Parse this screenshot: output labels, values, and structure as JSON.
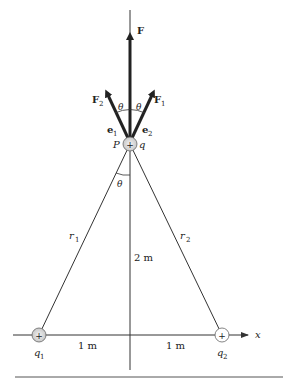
{
  "figure": {
    "labels": {
      "F": "F",
      "F1": "F",
      "F1_sub": "1",
      "F2": "F",
      "F2_sub": "2",
      "e1": "e",
      "e1_sub": "1",
      "e2": "e",
      "e2_sub": "2",
      "theta_left": "θ",
      "theta_right": "θ",
      "theta_lower": "θ",
      "P": "P",
      "q": "q",
      "r1": "r",
      "r1_sub": "1",
      "r2": "r",
      "r2_sub": "2",
      "height": "2 m",
      "left_distance": "1 m",
      "right_distance": "1 m",
      "q1": "q",
      "q1_sub": "1",
      "q2": "q",
      "q2_sub": "2",
      "x_axis": "x",
      "plus": "+"
    },
    "colors": {
      "line": "#333333",
      "charge_fill": "#d8d8d8",
      "text": "#222222"
    }
  }
}
